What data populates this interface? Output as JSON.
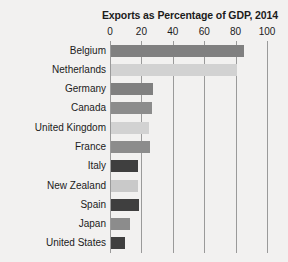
{
  "chart_data": {
    "type": "bar",
    "orientation": "horizontal",
    "title": "Exports as Percentage of GDP, 2014",
    "xlabel": "",
    "ylabel": "",
    "xlim": [
      0,
      100
    ],
    "xticks": [
      0,
      20,
      40,
      60,
      80,
      100
    ],
    "xtick_labels": [
      "0",
      "20",
      "40",
      "60",
      "80",
      "100"
    ],
    "grid": true,
    "grid_axis": "x",
    "legend": false,
    "categories": [
      "Belgium",
      "Netherlands",
      "Germany",
      "Canada",
      "United Kingdom",
      "France",
      "Italy",
      "New Zealand",
      "Spain",
      "Japan",
      "United States"
    ],
    "values": [
      85,
      80,
      27,
      26,
      24,
      25,
      17,
      17,
      18,
      12,
      9
    ],
    "bar_colors": [
      "#808080",
      "#d2d2d2",
      "#808080",
      "#8c8c8c",
      "#d2d2d2",
      "#8c8c8c",
      "#3f3f3f",
      "#c9c9c9",
      "#3f3f3f",
      "#8c8c8c",
      "#3f3f3f"
    ]
  },
  "style": {
    "background": "#f2f1f0",
    "plot_background": "#ffffff",
    "grid_color": "#9a9a9a",
    "text_color": "#1b1b1b"
  }
}
